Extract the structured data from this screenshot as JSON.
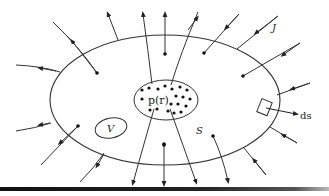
{
  "diagram": {
    "title": "",
    "labels": {
      "charge_density": "p(r)",
      "volume": "V",
      "surface": "S",
      "current_density": "J",
      "surface_element": "ds"
    },
    "colors": {
      "stroke": "#333333",
      "dot": "#111111",
      "background": "#ffffff",
      "bottom_bar": "#111111"
    },
    "shapes": {
      "surface_ellipse": {
        "cx": 165,
        "cy": 100,
        "rx": 115,
        "ry": 65
      },
      "charge_region_ellipse": {
        "cx": 166,
        "cy": 100,
        "rx": 32,
        "ry": 20
      },
      "volume_ellipse": {
        "cx": 111,
        "cy": 128,
        "rx": 16,
        "ry": 10
      }
    },
    "charges_count": 22,
    "flux_lines_outward": 9,
    "flux_lines_inward": 8
  }
}
